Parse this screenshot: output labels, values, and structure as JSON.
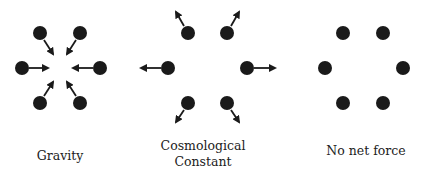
{
  "diagram": {
    "panels": [
      {
        "id": "gravity",
        "label_lines": [
          "Gravity"
        ],
        "arrow_direction": "inward",
        "particles": [
          {
            "cx": 40,
            "cy": 33,
            "ax1": 44,
            "ay1": 40,
            "ax2": 53,
            "ay2": 54
          },
          {
            "cx": 80,
            "cy": 33,
            "ax1": 76,
            "ay1": 40,
            "ax2": 67,
            "ay2": 54
          },
          {
            "cx": 22,
            "cy": 68,
            "ax1": 29,
            "ay1": 68,
            "ax2": 48,
            "ay2": 68
          },
          {
            "cx": 100,
            "cy": 68,
            "ax1": 93,
            "ay1": 68,
            "ax2": 73,
            "ay2": 68
          },
          {
            "cx": 40,
            "cy": 103,
            "ax1": 44,
            "ay1": 96,
            "ax2": 53,
            "ay2": 82
          },
          {
            "cx": 80,
            "cy": 103,
            "ax1": 76,
            "ay1": 96,
            "ax2": 67,
            "ay2": 82
          }
        ],
        "label_x": 60
      },
      {
        "id": "cosmological-constant",
        "label_lines": [
          "Cosmological",
          "Constant"
        ],
        "arrow_direction": "outward",
        "particles": [
          {
            "cx": 188,
            "cy": 33,
            "ax1": 184,
            "ay1": 26,
            "ax2": 176,
            "ay2": 12
          },
          {
            "cx": 227,
            "cy": 33,
            "ax1": 231,
            "ay1": 26,
            "ax2": 239,
            "ay2": 12
          },
          {
            "cx": 168,
            "cy": 68,
            "ax1": 161,
            "ay1": 68,
            "ax2": 141,
            "ay2": 68
          },
          {
            "cx": 247,
            "cy": 68,
            "ax1": 254,
            "ay1": 68,
            "ax2": 275,
            "ay2": 68
          },
          {
            "cx": 188,
            "cy": 103,
            "ax1": 184,
            "ay1": 110,
            "ax2": 176,
            "ay2": 122
          },
          {
            "cx": 227,
            "cy": 103,
            "ax1": 231,
            "ay1": 110,
            "ax2": 239,
            "ay2": 122
          }
        ],
        "label_x": 203
      },
      {
        "id": "no-net-force",
        "label_lines": [
          "No net force"
        ],
        "arrow_direction": "none",
        "particles": [
          {
            "cx": 343,
            "cy": 33
          },
          {
            "cx": 383,
            "cy": 33
          },
          {
            "cx": 325,
            "cy": 68
          },
          {
            "cx": 403,
            "cy": 68
          },
          {
            "cx": 343,
            "cy": 103
          },
          {
            "cx": 383,
            "cy": 103
          }
        ],
        "label_x": 366
      }
    ],
    "particle_radius": 7,
    "colors": {
      "particle": "#1a1a1a",
      "arrow": "#1a1a1a",
      "text": "#222222",
      "background": "#ffffff"
    }
  }
}
